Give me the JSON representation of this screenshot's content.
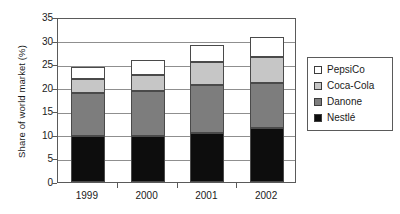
{
  "chart_data": {
    "type": "bar",
    "subtype": "stacked-column",
    "title": "",
    "xlabel": "",
    "ylabel": "Share of world market (%)",
    "categories": [
      "1999",
      "2000",
      "2001",
      "2002"
    ],
    "ylim": [
      0,
      35
    ],
    "yticks": [
      0,
      5,
      10,
      15,
      20,
      25,
      30,
      35
    ],
    "ytick_labels": [
      "0",
      "5",
      "10",
      "15",
      "20",
      "25",
      "30",
      "35"
    ],
    "grid": true,
    "grid_axis": "y",
    "legend_position": "right",
    "stack_order_bottom_to_top": [
      "Nestlé",
      "Danone",
      "Coca-Cola",
      "PepsiCo"
    ],
    "series": [
      {
        "name": "Nestlé",
        "color": "#0d0d0d",
        "values": [
          9.7,
          9.7,
          10.5,
          11.5
        ]
      },
      {
        "name": "Danone",
        "color": "#7d7d7d",
        "values": [
          9.2,
          9.6,
          10.0,
          9.5
        ]
      },
      {
        "name": "Coca-Cola",
        "color": "#c6c6c6",
        "values": [
          2.9,
          3.5,
          5.0,
          5.5
        ]
      },
      {
        "name": "PepsiCo",
        "color": "#ffffff",
        "values": [
          2.7,
          3.0,
          3.5,
          4.3
        ]
      }
    ],
    "stack_totals": [
      24.5,
      25.8,
      29.0,
      30.8
    ]
  },
  "legend": {
    "items": [
      {
        "label": "PepsiCo",
        "color": "#ffffff"
      },
      {
        "label": "Coca-Cola",
        "color": "#c6c6c6"
      },
      {
        "label": "Danone",
        "color": "#7d7d7d"
      },
      {
        "label": "Nestlé",
        "color": "#0d0d0d"
      }
    ]
  }
}
